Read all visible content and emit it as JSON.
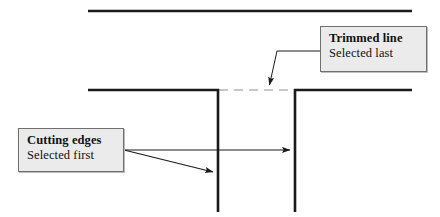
{
  "diagram": {
    "background_color": "#ffffff",
    "line_color": "#1a1a1a",
    "trimmed_line_color": "#b5b5b5",
    "callout_fill": "#ebebeb",
    "callout_border": "#6f6f6f",
    "callouts": [
      {
        "id": "trimmed-line",
        "line1": "Trimmed line",
        "line2": "Selected last",
        "x": 320,
        "y": 26,
        "width": 107,
        "height": 46
      },
      {
        "id": "cutting-edges",
        "line1": "Cutting edges",
        "line2": "Selected first",
        "x": 18,
        "y": 128,
        "width": 106,
        "height": 44
      }
    ],
    "geometry": {
      "top_line": {
        "x1": 88,
        "y1": 11,
        "x2": 412,
        "y2": 11
      },
      "middle_line_left": {
        "x1": 88,
        "y1": 90,
        "x2": 219,
        "y2": 90
      },
      "middle_line_right": {
        "x1": 294,
        "y1": 90,
        "x2": 412,
        "y2": 90
      },
      "trimmed_segment": {
        "x1": 219,
        "y1": 90,
        "x2": 294,
        "y2": 90,
        "style": "dashed"
      },
      "vertical_left": {
        "x1": 218,
        "y1": 89,
        "x2": 218,
        "y2": 211
      },
      "vertical_right": {
        "x1": 295,
        "y1": 89,
        "x2": 295,
        "y2": 211
      },
      "leader_trimmed": {
        "from_x": 320,
        "from_y": 51,
        "elbow_x": 277,
        "elbow_y": 51,
        "tip_x": 268,
        "tip_y": 89
      },
      "arrow_to_right_edge": {
        "from_x": 124,
        "from_y": 150,
        "tip_x": 294,
        "tip_y": 150
      },
      "arrow_to_left_edge": {
        "from_x": 124,
        "from_y": 150,
        "tip_x": 217,
        "tip_y": 174
      }
    }
  }
}
